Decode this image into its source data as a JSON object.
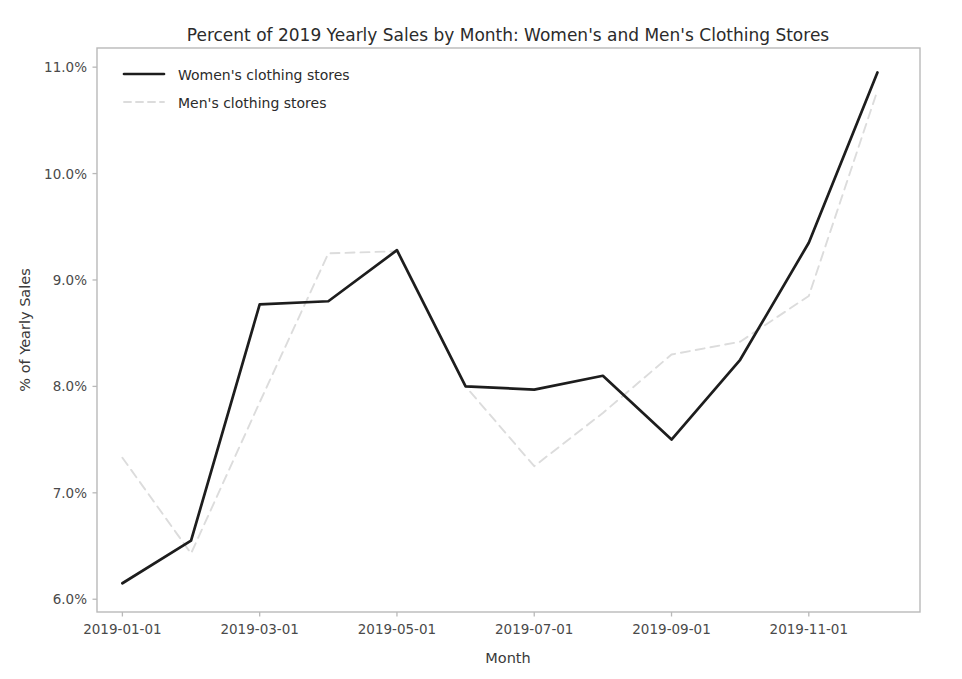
{
  "chart_data": {
    "type": "line",
    "title": "Percent of 2019 Yearly Sales by Month: Women's and Men's Clothing Stores",
    "xlabel": "Month",
    "ylabel": "% of Yearly Sales",
    "grid": false,
    "legend_position": "upper left",
    "x": [
      "2019-01-01",
      "2019-02-01",
      "2019-03-01",
      "2019-04-01",
      "2019-05-01",
      "2019-06-01",
      "2019-07-01",
      "2019-08-01",
      "2019-09-01",
      "2019-10-01",
      "2019-11-01",
      "2019-12-01"
    ],
    "xtick_labels": [
      "2019-01-01",
      "2019-03-01",
      "2019-05-01",
      "2019-07-01",
      "2019-09-01",
      "2019-11-01"
    ],
    "xtick_values": [
      "2019-01-01",
      "2019-03-01",
      "2019-05-01",
      "2019-07-01",
      "2019-09-01",
      "2019-11-01"
    ],
    "ytick_labels": [
      "6.0%",
      "7.0%",
      "8.0%",
      "9.0%",
      "10.0%",
      "11.0%"
    ],
    "ytick_values": [
      6.0,
      7.0,
      8.0,
      9.0,
      10.0,
      11.0
    ],
    "ylim": [
      5.88,
      11.18
    ],
    "xlim": [
      "2018-12-20",
      "2019-12-20"
    ],
    "series": [
      {
        "name": "Women's clothing stores",
        "style": "solid",
        "color": "#1d1d1d",
        "values": [
          6.15,
          6.55,
          8.77,
          8.8,
          9.28,
          8.0,
          7.97,
          8.1,
          7.5,
          8.25,
          9.35,
          10.95
        ]
      },
      {
        "name": "Men's clothing stores",
        "style": "dashed",
        "color": "#dcdcdc",
        "values": [
          7.33,
          6.43,
          7.85,
          9.25,
          9.27,
          8.0,
          7.25,
          7.75,
          8.3,
          8.42,
          8.85,
          10.78
        ]
      }
    ]
  },
  "legend": {
    "entries": [
      {
        "label": "Women's clothing stores",
        "style": "solid",
        "color": "#1d1d1d"
      },
      {
        "label": "Men's clothing stores",
        "style": "dashed",
        "color": "#dcdcdc"
      }
    ]
  }
}
